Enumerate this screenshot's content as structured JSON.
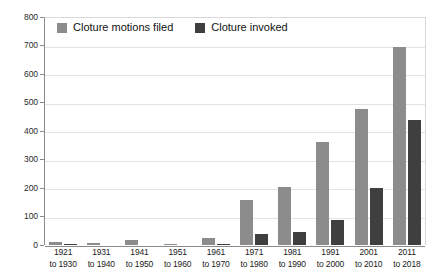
{
  "chart_data": {
    "type": "bar",
    "title": "",
    "subtitle": "",
    "xlabel": "",
    "ylabel": "",
    "ylim": [
      0,
      800
    ],
    "ytick_step": 100,
    "yticks": [
      0,
      100,
      200,
      300,
      400,
      500,
      600,
      700,
      800
    ],
    "grid": true,
    "legend_position": "top-left",
    "categories": [
      "1921 to 1930",
      "1931 to 1940",
      "1941 to 1950",
      "1951 to 1960",
      "1961 to 1970",
      "1971 to 1980",
      "1981 to 1990",
      "1991 to 2000",
      "2001 to 2010",
      "2011 to 2018"
    ],
    "category_lines": [
      [
        "1921",
        "to 1930"
      ],
      [
        "1931",
        "to 1940"
      ],
      [
        "1941",
        "to 1950"
      ],
      [
        "1951",
        "to 1960"
      ],
      [
        "1961",
        "to 1970"
      ],
      [
        "1971",
        "to 1980"
      ],
      [
        "1981",
        "to 1990"
      ],
      [
        "1991",
        "to 2000"
      ],
      [
        "2001",
        "to 2010"
      ],
      [
        "2011",
        "to 2018"
      ]
    ],
    "series": [
      {
        "name": "Cloture motions filed",
        "color": "#8c8c8c",
        "values": [
          11,
          8,
          17,
          2,
          25,
          158,
          204,
          361,
          477,
          695
        ]
      },
      {
        "name": "Cloture invoked",
        "color": "#3f3f3f",
        "values": [
          4,
          0,
          0,
          0,
          2,
          38,
          45,
          87,
          200,
          440
        ]
      }
    ]
  },
  "legend": {
    "items": [
      {
        "label": "Cloture motions filed",
        "swatch": "filed"
      },
      {
        "label": "Cloture invoked",
        "swatch": "invoked"
      }
    ]
  },
  "colors": {
    "series_filed": "#8c8c8c",
    "series_invoked": "#3f3f3f",
    "gridline": "#e3e3e3",
    "axis": "#8a8a8a",
    "background": "#ffffff",
    "text": "#1b1b1b"
  }
}
